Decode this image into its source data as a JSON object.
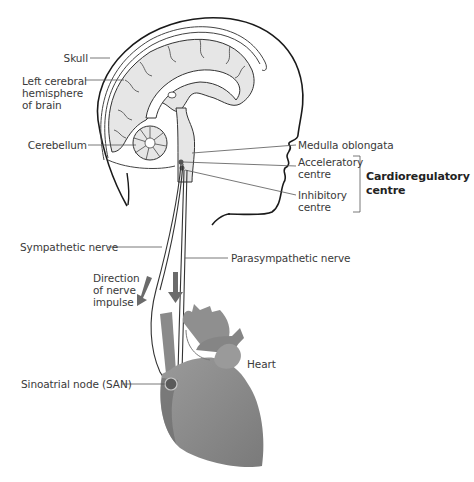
{
  "diagram": {
    "labels": {
      "skull": "Skull",
      "left_cerebral_line1": "Left cerebral",
      "left_cerebral_line2": "hemisphere",
      "left_cerebral_line3": "of brain",
      "cerebellum": "Cerebellum",
      "medulla": "Medulla oblongata",
      "acceleratory_line1": "Acceleratory",
      "acceleratory_line2": "centre",
      "inhibitory_line1": "Inhibitory",
      "inhibitory_line2": "centre",
      "cardioregulatory_line1": "Cardioregulatory",
      "cardioregulatory_line2": "centre",
      "sympathetic": "Sympathetic nerve",
      "parasympathetic": "Parasympathetic nerve",
      "direction_line1": "Direction",
      "direction_line2": "of nerve",
      "direction_line3": "impulse",
      "heart": "Heart",
      "san": "Sinoatrial node (SAN)"
    },
    "colors": {
      "outline": "#1a1a1a",
      "brain_fill": "#e6e6e6",
      "heart_fill": "#8c8c8c",
      "heart_dark": "#6e6e6e",
      "arrow": "#6b6b6b",
      "leader": "#555555"
    }
  }
}
